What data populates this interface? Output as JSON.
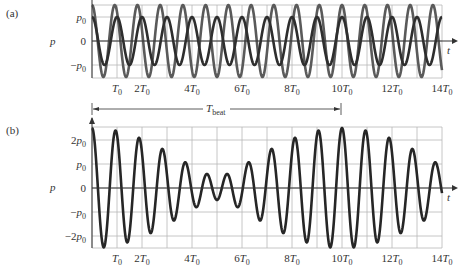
{
  "chart_data": [
    {
      "type": "line",
      "panel_label": "(a)",
      "title": "",
      "xlabel": "t",
      "ylabel": "p",
      "x_unit": "T0",
      "xlim": [
        0,
        14
      ],
      "ylim": [
        -1.5,
        1.5
      ],
      "grid": true,
      "x_ticks": [
        {
          "value": 1,
          "label": "T0"
        },
        {
          "value": 2,
          "label": "2T0"
        },
        {
          "value": 4,
          "label": "4T0"
        },
        {
          "value": 6,
          "label": "6T0"
        },
        {
          "value": 8,
          "label": "8T0"
        },
        {
          "value": 10,
          "label": "10T0"
        },
        {
          "value": 12,
          "label": "12T0"
        },
        {
          "value": 14,
          "label": "14T0"
        }
      ],
      "y_ticks": [
        {
          "value": 1,
          "label": "p0"
        },
        {
          "value": 0,
          "label": "0"
        },
        {
          "value": -1,
          "label": "-p0"
        }
      ],
      "series": [
        {
          "name": "wave 1",
          "amplitude_p0": 1.5,
          "frequency_f0": 1.1,
          "function": "1.5 p0 cos(2π·1.1·t/T0)",
          "color": "#5a5a5a"
        },
        {
          "name": "wave 2",
          "amplitude_p0": 1.0,
          "frequency_f0": 1.0,
          "function": "p0 cos(2π·t/T0)",
          "color": "#2e2e2e"
        }
      ]
    },
    {
      "type": "line",
      "panel_label": "(b)",
      "title": "",
      "xlabel": "t",
      "ylabel": "p",
      "x_unit": "T0",
      "xlim": [
        0,
        14
      ],
      "ylim": [
        -2.5,
        2.5
      ],
      "grid": true,
      "annotation": {
        "label": "Tbeat",
        "from": 0,
        "to": 10
      },
      "x_ticks": [
        {
          "value": 1,
          "label": "T0"
        },
        {
          "value": 2,
          "label": "2T0"
        },
        {
          "value": 4,
          "label": "4T0"
        },
        {
          "value": 6,
          "label": "6T0"
        },
        {
          "value": 8,
          "label": "8T0"
        },
        {
          "value": 10,
          "label": "10T0"
        },
        {
          "value": 12,
          "label": "12T0"
        },
        {
          "value": 14,
          "label": "14T0"
        }
      ],
      "y_ticks": [
        {
          "value": 2,
          "label": "2p0"
        },
        {
          "value": 1,
          "label": "p0"
        },
        {
          "value": 0,
          "label": "0"
        },
        {
          "value": -1,
          "label": "-p0"
        },
        {
          "value": -2,
          "label": "-2p0"
        }
      ],
      "series": [
        {
          "name": "sum (beats)",
          "function": "1.5 p0 cos(2π·1.1·t/T0) + p0 cos(2π·t/T0)",
          "color": "#262626",
          "envelope_max_p0": 2.5,
          "envelope_min_p0": 0.5,
          "beat_period_T0": 10
        }
      ]
    }
  ],
  "labels": {
    "a": "(a)",
    "b": "(b)",
    "p": "p",
    "t": "t",
    "tbeat_main": "T",
    "tbeat_sub": "beat"
  }
}
